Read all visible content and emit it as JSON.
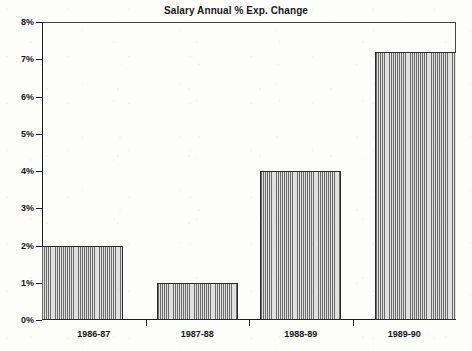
{
  "chart_data": {
    "type": "bar",
    "title": "Salary Annual % Exp. Change",
    "xlabel": "",
    "ylabel": "",
    "categories": [
      "1986-87",
      "1987-88",
      "1988-89",
      "1989-90"
    ],
    "values": [
      2.0,
      1.0,
      4.0,
      7.2
    ],
    "ylim": [
      0,
      8
    ],
    "ytick_values": [
      0,
      1,
      2,
      3,
      4,
      5,
      6,
      7,
      8
    ],
    "ytick_labels": [
      "0%",
      "1%",
      "2%",
      "3%",
      "4%",
      "5%",
      "6%",
      "7%",
      "8%"
    ],
    "grid": false,
    "legend": null,
    "series": [
      {
        "name": "Salary Annual % Exp. Change",
        "values": [
          2.0,
          1.0,
          4.0,
          7.2
        ],
        "fill": "vertical-hatch-gray",
        "color": "#a6a6a6",
        "edge_color": "#2a2a2e"
      }
    ]
  },
  "figure": {
    "background_color": "#fdfdfc",
    "axis_color": "#1c1c1e",
    "text_color": "#151517"
  }
}
